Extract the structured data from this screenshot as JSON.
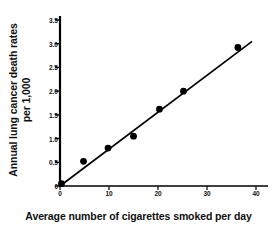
{
  "chart_data": {
    "type": "scatter",
    "title": "",
    "subtitle": "",
    "xlabel": "Average number of cigarettes smoked per day",
    "ylabel_line1": "Annual lung cancer death rates",
    "ylabel_line2": "per 1,000",
    "ylabel": "Annual lung cancer death rates per 1,000",
    "xlim": [
      0,
      40
    ],
    "ylim": [
      0,
      3.5
    ],
    "xticks": [
      0,
      10,
      20,
      30,
      40
    ],
    "xtick_labels": [
      "0",
      "10",
      "20",
      "30",
      "40"
    ],
    "yticks": [
      0,
      0.5,
      1.0,
      1.5,
      2.0,
      2.5,
      3.0,
      3.5
    ],
    "ytick_labels": [
      "0",
      "0.5",
      "1.0",
      "1.5",
      "2.0",
      "2.5",
      "3.0",
      "3.5"
    ],
    "grid": false,
    "legend": null,
    "legend_position": "none",
    "marker_color": "#000000",
    "line_color": "#000000",
    "axis_color": "#000000",
    "background_color": "#ffffff",
    "points": [
      {
        "x": 0.3,
        "y": 0.05
      },
      {
        "x": 4.8,
        "y": 0.52
      },
      {
        "x": 9.8,
        "y": 0.8
      },
      {
        "x": 15.0,
        "y": 1.05
      },
      {
        "x": 20.3,
        "y": 1.62
      },
      {
        "x": 25.2,
        "y": 2.0
      },
      {
        "x": 36.3,
        "y": 2.92
      }
    ],
    "x": [
      0.3,
      4.8,
      9.8,
      15.0,
      20.3,
      25.2,
      36.3
    ],
    "values": [
      0.05,
      0.52,
      0.8,
      1.05,
      1.62,
      2.0,
      2.92
    ],
    "trendline": {
      "type": "line",
      "x_start": 0,
      "y_start": 0,
      "x_end": 39.2,
      "y_end": 3.05
    },
    "annotations": []
  }
}
